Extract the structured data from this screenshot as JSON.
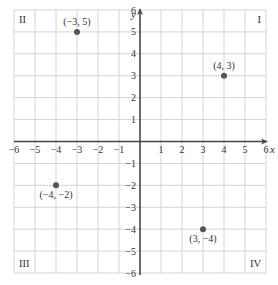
{
  "chart_data": {
    "type": "scatter",
    "title": "",
    "xlabel": "x",
    "ylabel": "y",
    "xlim": [
      -6,
      6
    ],
    "ylim": [
      -6,
      6
    ],
    "grid": true,
    "x_ticks": [
      "-6",
      "-5",
      "-4",
      "-3",
      "-2",
      "-1",
      "1",
      "2",
      "3",
      "4",
      "5",
      "6"
    ],
    "y_ticks": [
      "6",
      "5",
      "4",
      "3",
      "2",
      "1",
      "-1",
      "-2",
      "-3",
      "-4",
      "-5",
      "-6"
    ],
    "quadrant_labels": [
      {
        "label": "II",
        "position": "top-left"
      },
      {
        "label": "I",
        "position": "top-right"
      },
      {
        "label": "III",
        "position": "bottom-left"
      },
      {
        "label": "IV",
        "position": "bottom-right"
      }
    ],
    "points": [
      {
        "x": -3,
        "y": 5,
        "label": "(−3, 5)"
      },
      {
        "x": 4,
        "y": 3,
        "label": "(4, 3)"
      },
      {
        "x": -4,
        "y": -2,
        "label": "(−4, −2)"
      },
      {
        "x": 3,
        "y": -4,
        "label": "(3, −4)"
      }
    ],
    "colors": {
      "grid": "#d4d4d4",
      "axis": "#444444",
      "point": "#555555",
      "text": "#333333"
    }
  }
}
